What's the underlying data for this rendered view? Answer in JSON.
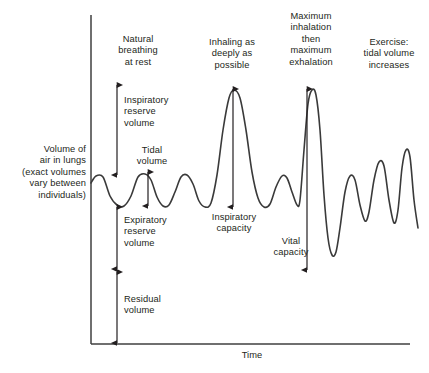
{
  "figure": {
    "kind": "spirogram",
    "axes": {
      "y_label": "Volume of\nair in lungs\n(exact volumes\nvary between\nindividuals)",
      "x_label": "Time",
      "stroke": "#3a3a3a"
    },
    "phase_labels": [
      {
        "name": "natural-breathing",
        "text": "Natural\nbreathing\nat rest"
      },
      {
        "name": "deep-inhalation",
        "text": "Inhaling as\ndeeply as\npossible"
      },
      {
        "name": "max-inhale-exhale",
        "text": "Maximum\ninhalation\nthen\nmaximum\nexhalation"
      },
      {
        "name": "exercise",
        "text": "Exercise:\ntidal volume\nincreases"
      }
    ],
    "measure_labels": [
      {
        "name": "inspiratory-reserve-volume",
        "text": "Inspiratory\nreserve\nvolume"
      },
      {
        "name": "tidal-volume",
        "text": "Tidal\nvolume"
      },
      {
        "name": "expiratory-reserve-volume",
        "text": "Expiratory\nreserve\nvolume"
      },
      {
        "name": "residual-volume",
        "text": "Residual\nvolume"
      },
      {
        "name": "inspiratory-capacity",
        "text": "Inspiratory\ncapacity"
      },
      {
        "name": "vital-capacity",
        "text": "Vital\ncapacity"
      }
    ]
  },
  "chart_data": {
    "type": "line",
    "title": "",
    "xlabel": "Time",
    "ylabel": "Volume of air in lungs (exact volumes vary between individuals)",
    "grid": false,
    "legend": "none",
    "axis_ranges": {
      "x_px": [
        91,
        410
      ],
      "y_px": [
        15,
        344
      ]
    },
    "reference_levels_px": {
      "tidal_peak": 175,
      "tidal_trough": 206,
      "max_inhalation": 89,
      "residual_top": 270,
      "baseline": 344
    },
    "trace_points_px": [
      [
        91,
        183
      ],
      [
        96,
        176
      ],
      [
        103,
        177
      ],
      [
        110,
        196
      ],
      [
        117,
        205
      ],
      [
        124,
        206
      ],
      [
        131,
        196
      ],
      [
        138,
        177
      ],
      [
        145,
        174
      ],
      [
        151,
        180
      ],
      [
        157,
        197
      ],
      [
        163,
        206
      ],
      [
        169,
        205
      ],
      [
        175,
        192
      ],
      [
        181,
        177
      ],
      [
        187,
        175
      ],
      [
        193,
        184
      ],
      [
        199,
        201
      ],
      [
        205,
        207
      ],
      [
        211,
        203
      ],
      [
        217,
        175
      ],
      [
        223,
        130
      ],
      [
        229,
        98
      ],
      [
        234,
        90
      ],
      [
        240,
        98
      ],
      [
        246,
        130
      ],
      [
        252,
        172
      ],
      [
        258,
        198
      ],
      [
        264,
        207
      ],
      [
        270,
        204
      ],
      [
        276,
        187
      ],
      [
        282,
        176
      ],
      [
        287,
        178
      ],
      [
        292,
        192
      ],
      [
        297,
        205
      ],
      [
        300,
        200
      ],
      [
        304,
        150
      ],
      [
        308,
        104
      ],
      [
        312,
        90
      ],
      [
        316,
        95
      ],
      [
        320,
        130
      ],
      [
        324,
        195
      ],
      [
        328,
        238
      ],
      [
        332,
        255
      ],
      [
        336,
        252
      ],
      [
        340,
        228
      ],
      [
        345,
        192
      ],
      [
        350,
        176
      ],
      [
        355,
        180
      ],
      [
        360,
        205
      ],
      [
        365,
        221
      ],
      [
        369,
        212
      ],
      [
        374,
        180
      ],
      [
        379,
        162
      ],
      [
        384,
        166
      ],
      [
        389,
        200
      ],
      [
        394,
        223
      ],
      [
        398,
        210
      ],
      [
        402,
        168
      ],
      [
        406,
        150
      ],
      [
        410,
        157
      ],
      [
        414,
        200
      ],
      [
        418,
        228
      ]
    ],
    "annotated_measures": [
      {
        "label": "Inspiratory reserve volume",
        "arrow": "double",
        "x_px": 117,
        "y_from_px": 85,
        "y_to_px": 175
      },
      {
        "label": "Tidal volume",
        "arrow": "double",
        "x_px": 148,
        "y_from_px": 172,
        "y_to_px": 206
      },
      {
        "label": "Expiratory reserve volume",
        "arrow": "double",
        "x_px": 117,
        "y_from_px": 207,
        "y_to_px": 269
      },
      {
        "label": "Residual volume",
        "arrow": "double",
        "x_px": 117,
        "y_from_px": 272,
        "y_to_px": 343
      },
      {
        "label": "Inspiratory capacity",
        "arrow": "double",
        "x_px": 233,
        "y_from_px": 89,
        "y_to_px": 207
      },
      {
        "label": "Vital capacity",
        "arrow": "double",
        "x_px": 307,
        "y_from_px": 89,
        "y_to_px": 270
      }
    ]
  }
}
